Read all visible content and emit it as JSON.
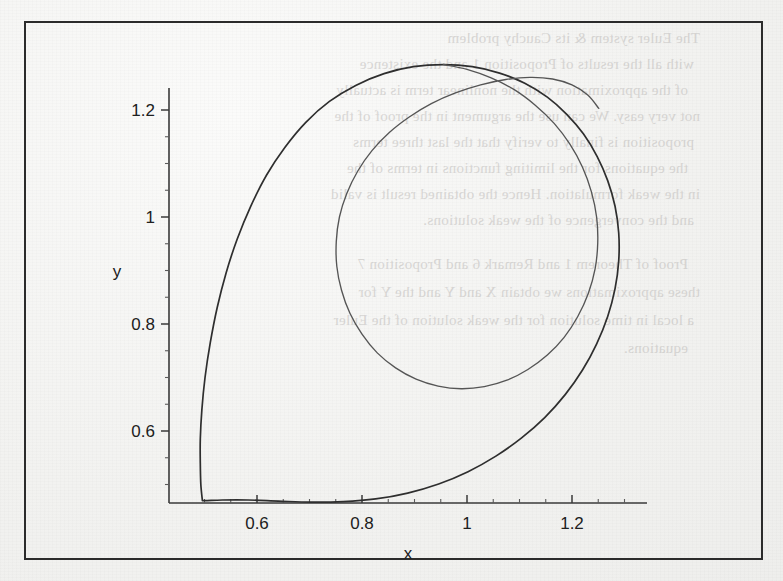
{
  "page": {
    "width": 783,
    "height": 581,
    "background_color": "#f4f4f2",
    "frame_color": "#2b2b2b"
  },
  "bleed_through_text": {
    "note": "faint mirrored show-through text from reverse side of scanned page",
    "lines": [
      "The Euler system & its Cauchy problem",
      "with all the results of Proposition 1 and the existence",
      "of the approximation with the nonlinear term is actually",
      "not very easy. We can use the argument in the proof of the",
      "proposition is finally to verify that the last three terms",
      "the equations for the limiting functions in terms of the",
      "in the weak formulation. Hence the obtained result is valid",
      "and the convergence of the weak solutions.",
      "Proof of Theorem 1 and Remark 6 and Proposition 7",
      "these approximations we obtain X and Y and the Y for",
      "a local in time solution for the weak solution of the Euler",
      "equations."
    ]
  },
  "chart_data": {
    "type": "line",
    "title": "",
    "subtitle": "",
    "xlabel": "x",
    "ylabel": "y",
    "grid": false,
    "legend": null,
    "xlim": [
      0.47,
      1.31
    ],
    "ylim": [
      0.45,
      1.31
    ],
    "x_ticks_major": [
      0.6,
      0.8,
      1,
      1.2
    ],
    "x_tick_labels": [
      "0.6",
      "0.8",
      "1",
      "1.2"
    ],
    "y_ticks_major": [
      0.6,
      0.8,
      1,
      1.2
    ],
    "y_tick_labels": [
      "0.6",
      "0.8",
      "1",
      "1.2"
    ],
    "x_tick_minor_step": 0.05,
    "y_tick_minor_step": 0.05,
    "series": [
      {
        "name": "outer-orbit",
        "color": "#2e2e2e",
        "closed": true,
        "points": [
          [
            0.496,
            0.47
          ],
          [
            0.493,
            0.5
          ],
          [
            0.492,
            0.54
          ],
          [
            0.492,
            0.585
          ],
          [
            0.495,
            0.64
          ],
          [
            0.501,
            0.7
          ],
          [
            0.511,
            0.765
          ],
          [
            0.524,
            0.83
          ],
          [
            0.541,
            0.895
          ],
          [
            0.562,
            0.958
          ],
          [
            0.588,
            1.02
          ],
          [
            0.618,
            1.078
          ],
          [
            0.653,
            1.13
          ],
          [
            0.693,
            1.177
          ],
          [
            0.738,
            1.216
          ],
          [
            0.788,
            1.246
          ],
          [
            0.842,
            1.268
          ],
          [
            0.898,
            1.281
          ],
          [
            0.955,
            1.285
          ],
          [
            1.01,
            1.281
          ],
          [
            1.062,
            1.269
          ],
          [
            1.11,
            1.25
          ],
          [
            1.153,
            1.224
          ],
          [
            1.19,
            1.192
          ],
          [
            1.222,
            1.155
          ],
          [
            1.248,
            1.113
          ],
          [
            1.268,
            1.068
          ],
          [
            1.282,
            1.02
          ],
          [
            1.289,
            0.97
          ],
          [
            1.289,
            0.918
          ],
          [
            1.282,
            0.866
          ],
          [
            1.268,
            0.814
          ],
          [
            1.247,
            0.763
          ],
          [
            1.22,
            0.714
          ],
          [
            1.187,
            0.668
          ],
          [
            1.148,
            0.625
          ],
          [
            1.104,
            0.587
          ],
          [
            1.055,
            0.553
          ],
          [
            1.002,
            0.524
          ],
          [
            0.946,
            0.501
          ],
          [
            0.887,
            0.484
          ],
          [
            0.826,
            0.473
          ],
          [
            0.764,
            0.468
          ],
          [
            0.702,
            0.467
          ],
          [
            0.641,
            0.469
          ],
          [
            0.583,
            0.471
          ],
          [
            0.534,
            0.471
          ],
          [
            0.505,
            0.47
          ],
          [
            0.496,
            0.47
          ]
        ]
      },
      {
        "name": "inner-orbit",
        "color": "#555555",
        "closed": true,
        "points": [
          [
            0.955,
            1.285
          ],
          [
            1.0,
            1.276
          ],
          [
            1.046,
            1.26
          ],
          [
            1.09,
            1.238
          ],
          [
            1.13,
            1.209
          ],
          [
            1.166,
            1.175
          ],
          [
            1.196,
            1.136
          ],
          [
            1.22,
            1.093
          ],
          [
            1.237,
            1.047
          ],
          [
            1.247,
            0.999
          ],
          [
            1.249,
            0.951
          ],
          [
            1.244,
            0.903
          ],
          [
            1.231,
            0.857
          ],
          [
            1.211,
            0.814
          ],
          [
            1.185,
            0.775
          ],
          [
            1.153,
            0.742
          ],
          [
            1.116,
            0.715
          ],
          [
            1.076,
            0.695
          ],
          [
            1.033,
            0.683
          ],
          [
            0.989,
            0.679
          ],
          [
            0.945,
            0.684
          ],
          [
            0.903,
            0.697
          ],
          [
            0.864,
            0.718
          ],
          [
            0.829,
            0.746
          ],
          [
            0.8,
            0.781
          ],
          [
            0.777,
            0.82
          ],
          [
            0.761,
            0.863
          ],
          [
            0.752,
            0.908
          ],
          [
            0.751,
            0.954
          ],
          [
            0.757,
            1.0
          ],
          [
            0.771,
            1.044
          ],
          [
            0.792,
            1.086
          ],
          [
            0.819,
            1.124
          ],
          [
            0.852,
            1.158
          ],
          [
            0.89,
            1.187
          ],
          [
            0.932,
            1.212
          ],
          [
            0.978,
            1.232
          ],
          [
            1.026,
            1.247
          ],
          [
            1.074,
            1.257
          ],
          [
            1.12,
            1.261
          ],
          [
            1.163,
            1.258
          ],
          [
            1.2,
            1.247
          ],
          [
            1.23,
            1.228
          ],
          [
            1.251,
            1.203
          ]
        ]
      }
    ]
  },
  "axes": {
    "x_axis_label": "x",
    "y_axis_label": "y"
  }
}
